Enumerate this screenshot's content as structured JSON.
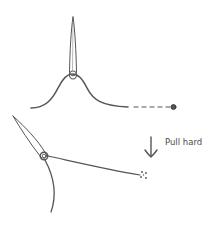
{
  "diagram": {
    "steps": [
      {
        "name": "step-1-knot-at-needle-eye",
        "description": "Needle with thread looped at eye, thread ends trailing"
      },
      {
        "name": "step-2-pull",
        "description": "Needle tilted with thread pulled taut"
      }
    ],
    "annotation": {
      "label": "Pull hard",
      "icon": "arrow-down-icon"
    },
    "colors": {
      "stroke": "#555555",
      "text": "#4a4a4a",
      "background": "#ffffff"
    }
  }
}
